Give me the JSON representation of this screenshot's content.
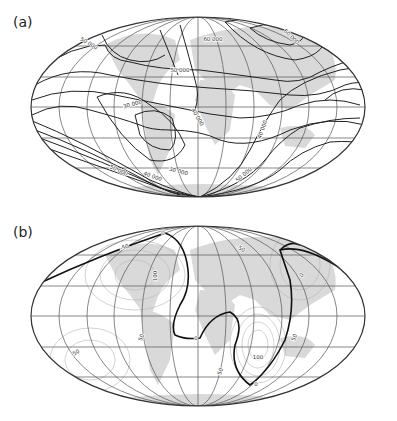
{
  "panels": [
    {
      "label": "(a)",
      "contour_labels": [
        {
          "text": "50 000",
          "x": 88,
          "y": 45,
          "rot": 30
        },
        {
          "text": "60 000",
          "x": 213,
          "y": 41,
          "rot": 0
        },
        {
          "text": "60 000",
          "x": 290,
          "y": 38,
          "rot": 45
        },
        {
          "text": "50 000",
          "x": 180,
          "y": 72,
          "rot": 0
        },
        {
          "text": "30 000",
          "x": 133,
          "y": 106,
          "rot": -15
        },
        {
          "text": "40 000",
          "x": 196,
          "y": 118,
          "rot": 60
        },
        {
          "text": "40 000",
          "x": 264,
          "y": 130,
          "rot": -70
        },
        {
          "text": "50 000",
          "x": 245,
          "y": 176,
          "rot": -40
        },
        {
          "text": "40 000",
          "x": 152,
          "y": 178,
          "rot": 20
        },
        {
          "text": "50 000",
          "x": 118,
          "y": 172,
          "rot": 25
        },
        {
          "text": "30 000",
          "x": 178,
          "y": 173,
          "rot": 15
        }
      ]
    },
    {
      "label": "(b)",
      "contour_labels": [
        {
          "text": "0",
          "x": 163,
          "y": 235,
          "rot": 0
        },
        {
          "text": "-50",
          "x": 125,
          "y": 249,
          "rot": -20
        },
        {
          "text": "100",
          "x": 157,
          "y": 276,
          "rot": -90
        },
        {
          "text": "-50",
          "x": 240,
          "y": 250,
          "rot": 30
        },
        {
          "text": "0",
          "x": 303,
          "y": 276,
          "rot": -60
        },
        {
          "text": "0",
          "x": 196,
          "y": 340,
          "rot": 0
        },
        {
          "text": "50",
          "x": 143,
          "y": 338,
          "rot": -70
        },
        {
          "text": "50",
          "x": 77,
          "y": 354,
          "rot": -30
        },
        {
          "text": "100",
          "x": 258,
          "y": 359,
          "rot": 0
        },
        {
          "text": "50",
          "x": 296,
          "y": 338,
          "rot": -70
        },
        {
          "text": "50",
          "x": 222,
          "y": 372,
          "rot": -70
        },
        {
          "text": "0",
          "x": 256,
          "y": 386,
          "rot": 0
        }
      ]
    }
  ],
  "colors": {
    "land": "#d9d9d9",
    "grid": "#555555",
    "contour": "#222222",
    "contour_light": "#b5b5b5",
    "outline": "#333333"
  }
}
